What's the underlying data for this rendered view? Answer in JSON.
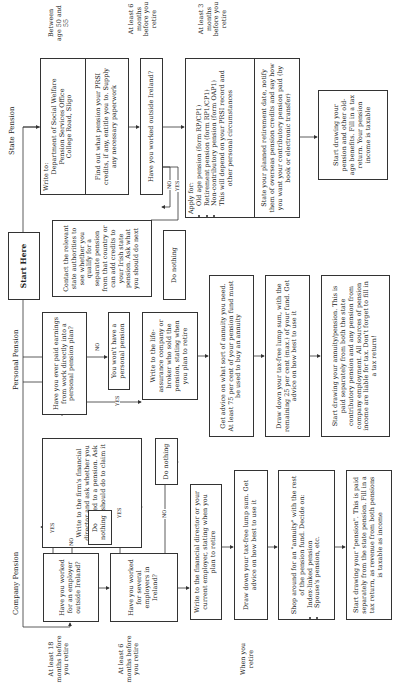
{
  "start": {
    "label": "Start Here"
  },
  "columns": {
    "company": "Company Pension",
    "personal": "Personal Pension",
    "state": "State Pension"
  },
  "timeline_left": [
    "At least 18 months before you retire",
    "At least 6 months before you retire",
    "When you retire"
  ],
  "timeline_right": [
    "Between age 50 and 55",
    "At least 6 months before you retire",
    "At least 3 months before you retire"
  ],
  "company": {
    "q_outside": "Have you worked for an employer outside Ireland?",
    "q_several": "Have you worked for several employers in Ireland?",
    "write_firm": "Write to the firm's financial director and ask whether you are entitled to a pension. Ask what you should do to claim it",
    "do_nothing_1": "Do nothing",
    "do_nothing_2": "Do nothing",
    "write_director": "Write to the financial director or your current employer, stating when you plan to retire",
    "draw_down": "Draw down your tax-free lump sum. Get advice on how best to use it",
    "shop_around": "Shop around for an \"annuity\" with the rest of the pension fund. Decide on:",
    "shop_items": [
      "Index-linked pension",
      "Spouse's pension, etc."
    ],
    "start_drawing": "Start drawing your \"pension\". This is paid separately from the state pension. Fill in a tax return, as revenue from both pensions is taxable as income"
  },
  "personal": {
    "q_paid": "Have you ever paid earnings from work directly into a personal pension plan?",
    "no_pension": "You won't have a personal pension",
    "write_insurer": "Write to the life-assurance company or broker who sold the pension, stating when you plan to retire",
    "advice": "Get advice on what sort of annuity you need. At least 75 per cent of your pension fund must be used to buy an annuity",
    "draw_down": "Draw down your tax-free lump sum, with the remaining 25 per cent (max.) of your fund. Get advice on how best to use it",
    "start_drawing": "Start drawing your annuity/pension. This is paid separately from both the state contributory pension and any pension from company employment. All sources of pension income are liable for tax. Don't forget to fill in a tax return!"
  },
  "state": {
    "write_to_label": "Write to:",
    "address": [
      "Department of Social Welfare",
      "Pension Services Office",
      "College Road, Sligo"
    ],
    "find_out": "Find out what pension your PRSI credits, if any, entitle you to. Supply any necessary paperwork",
    "q_outside": "Have you worked outside Ireland?",
    "contact": "Contact the relevant state authorities to see whether you qualify for a separate pension from that country or can add credits to your Irish state pension. Ask what you should do next",
    "do_nothing": "Do nothing",
    "apply_label": "Apply for:",
    "apply_items": [
      "Old age pension (form RP/CP1)",
      "Retirement pension (form RP1/CP1)",
      "Non-contributory pension (form OAP1)"
    ],
    "apply_note": "This will depend on your PRSI record and other personal circumstances",
    "state_date": "State your planned retirement date, notify them of overseas pension credits and say how you want your contributory pension paid (by book or electronic transfer)",
    "start_drawing": "Start drawing your pension and other old-age benefits. Fill in a tax return. Your pension income is taxable"
  },
  "connectors": {
    "yes": "YES",
    "no": "NO"
  }
}
